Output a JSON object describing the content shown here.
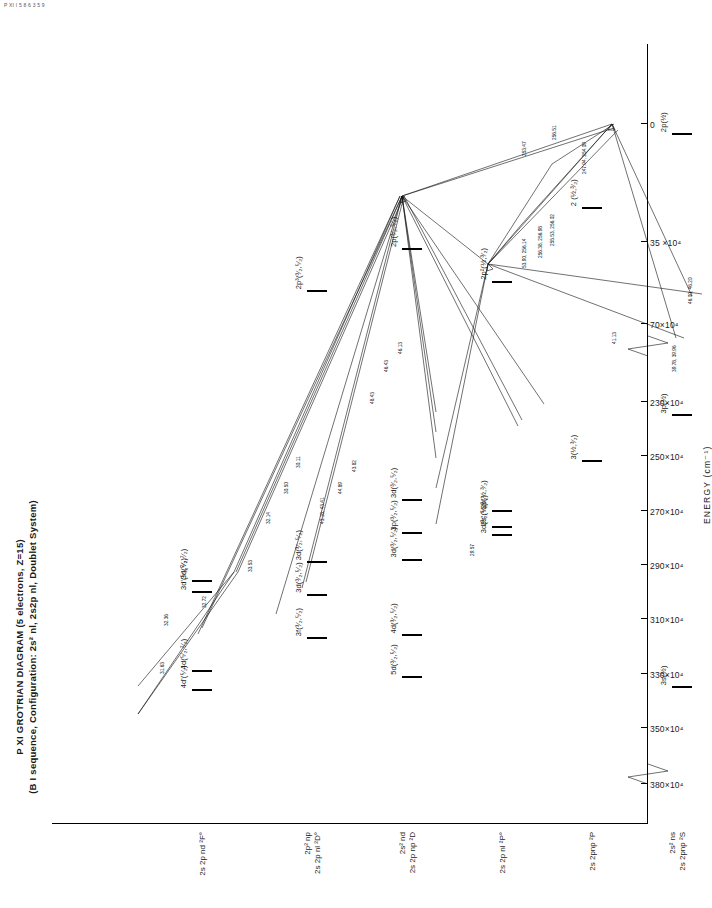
{
  "corner_note": "P XI  I 5 8 6 3 5 9",
  "title": {
    "line1": "P XI GROTRIAN DIAGRAM (5 electrons, Z=15)",
    "line2": "(B I sequence, Configuration: 2s² nl, 2s2p nl, Doublet System)"
  },
  "axis": {
    "label": "ENERGY  (cm⁻¹)",
    "ticks": [
      {
        "value": 380,
        "label": "380×10⁴"
      },
      {
        "value": 350,
        "label": "350×10⁴"
      },
      {
        "value": 330,
        "label": "330×10⁴"
      },
      {
        "value": 310,
        "label": "310×10⁴"
      },
      {
        "value": 290,
        "label": "290×10⁴"
      },
      {
        "value": 270,
        "label": "270×10⁴"
      },
      {
        "value": 250,
        "label": "250×10⁴"
      },
      {
        "value": 230,
        "label": "230×10⁴"
      },
      {
        "value": 70,
        "label": "70×10⁴"
      },
      {
        "value": 35,
        "label": "35 ×10⁴"
      },
      {
        "value": 0,
        "label": "0"
      }
    ],
    "breaks": [
      "between 380 and 350",
      "between 230 and 70"
    ]
  },
  "columns": [
    {
      "id": "c1",
      "head_top": "2s² ns",
      "head_bot": "2s 2pnp ²S"
    },
    {
      "id": "c2",
      "head_top": "",
      "head_bot": "2s 2pnp ²P"
    },
    {
      "id": "c3",
      "head_top": "",
      "head_bot": "2s 2p nl ²P°"
    },
    {
      "id": "c4",
      "head_top": "2s² nd",
      "head_bot": "2s 2p np ²D"
    },
    {
      "id": "c5",
      "head_top": "2p² np",
      "head_bot": "2s 2p nl ²D°"
    },
    {
      "id": "c6",
      "head_top": "",
      "head_bot": "2s 2p nd ²F°"
    }
  ],
  "levels": [
    {
      "col": "c1",
      "label": "3p(½)",
      "energy": 235
    },
    {
      "col": "c1",
      "label": "3s(½)",
      "energy": 225
    },
    {
      "col": "c1",
      "label": "2p(½)",
      "energy": 3
    },
    {
      "col": "c2",
      "label": "3(½,³⁄₂)",
      "energy": 252
    },
    {
      "col": "c2",
      "label": "2 (½,³⁄₂)",
      "energy": 25
    },
    {
      "col": "c3",
      "label": "3d(³⁄₂,⁵⁄₂)",
      "energy": 279
    },
    {
      "col": "c3",
      "label": "3s'(½,³⁄₂)",
      "energy": 276
    },
    {
      "col": "c3",
      "label": "3s(½,³⁄₂)",
      "energy": 270
    },
    {
      "col": "c3",
      "label": "2p²(½,³⁄₂)",
      "energy": 52
    },
    {
      "col": "c4",
      "label": "5d(³⁄₂,⁵⁄₂)",
      "energy": 331
    },
    {
      "col": "c4",
      "label": "4d(³⁄₂,⁵⁄₂)",
      "energy": 316
    },
    {
      "col": "c4",
      "label": "3d(³⁄₂,⁵⁄₂)",
      "energy": 288
    },
    {
      "col": "c4",
      "label": "3p(³⁄₂,⁵⁄₂)",
      "energy": 278
    },
    {
      "col": "c4",
      "label": "3d(³⁄₂,⁵⁄₂)",
      "energy": 266
    },
    {
      "col": "c4",
      "label": "2p(³⁄₂,⁵⁄₂)",
      "energy": 38
    },
    {
      "col": "c5",
      "label": "3f(³⁄₂,⁵⁄₂)",
      "energy": 317
    },
    {
      "col": "c5",
      "label": "3d(³⁄₂,⁵⁄₂)",
      "energy": 301
    },
    {
      "col": "c5",
      "label": "3d(³⁄₂,⁵⁄₂)",
      "energy": 289
    },
    {
      "col": "c5",
      "label": "2p³(³⁄₂,⁵⁄₂)",
      "energy": 56
    },
    {
      "col": "c6",
      "label": "4d'(⁵⁄₂)",
      "energy": 336
    },
    {
      "col": "c6",
      "label": "4d(⁵⁄₂,⁷⁄₂)",
      "energy": 329
    },
    {
      "col": "c6",
      "label": "3d'(⁵⁄₂,⁷⁄₂)",
      "energy": 300
    },
    {
      "col": "c6",
      "label": "3d(⁵⁄₂,⁷⁄₂)",
      "energy": 296
    }
  ],
  "transitions": [
    {
      "wavelength": "31.63"
    },
    {
      "wavelength": "32.36"
    },
    {
      "wavelength": "32.72"
    },
    {
      "wavelength": "33.53"
    },
    {
      "wavelength": "32.14"
    },
    {
      "wavelength": "30.50"
    },
    {
      "wavelength": "30.11"
    },
    {
      "wavelength": "43.18, 43.41"
    },
    {
      "wavelength": "44.89"
    },
    {
      "wavelength": "43.82"
    },
    {
      "wavelength": "48.43"
    },
    {
      "wavelength": "46.43"
    },
    {
      "wavelength": "46.13"
    },
    {
      "wavelength": "41.13"
    },
    {
      "wavelength": "39.78, 39.96"
    },
    {
      "wavelength": "46.00, 46.20"
    },
    {
      "wavelength": "53.90, 256.14"
    },
    {
      "wavelength": "256.38, 256.98"
    },
    {
      "wavelength": "255.53, 256.02"
    },
    {
      "wavelength": "247.94, 254.09"
    },
    {
      "wavelength": "253.47"
    },
    {
      "wavelength": "256.51"
    },
    {
      "wavelength": "29.57"
    }
  ]
}
